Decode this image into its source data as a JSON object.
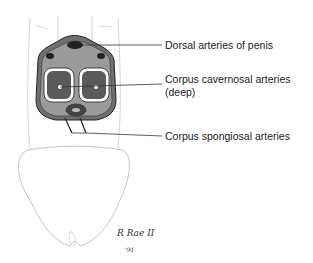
{
  "figure": {
    "labels": [
      {
        "id": "dorsal",
        "text": "Dorsal arteries of penis"
      },
      {
        "id": "cavernosal",
        "text": "Corpus cavernosal arteries"
      },
      {
        "id": "cavernosal_sub",
        "text": "(deep)"
      },
      {
        "id": "spongiosal",
        "text": "Corpus spongiosal arteries"
      }
    ],
    "signature": {
      "name": "R Rae II",
      "year": "'91"
    }
  }
}
